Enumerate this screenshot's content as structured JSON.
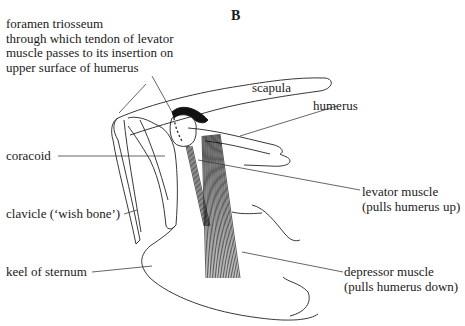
{
  "figure": {
    "panel_letter": "B",
    "labels": {
      "foramen": [
        "foramen triosseum",
        "through which tendon of levator",
        "muscle passes to its insertion on",
        "upper surface of humerus"
      ],
      "scapula": "scapula",
      "humerus": "humerus",
      "coracoid": "coracoid",
      "levator": [
        "levator muscle",
        "(pulls humerus up)"
      ],
      "clavicle": "clavicle (‘wish bone’)",
      "keel": "keel of sternum",
      "depressor": [
        "depressor muscle",
        "(pulls humerus down)"
      ]
    }
  }
}
